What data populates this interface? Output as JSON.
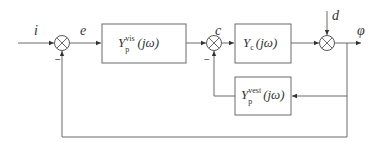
{
  "diagram": {
    "type": "feedback-control-block-diagram",
    "signals": {
      "input": "i",
      "error": "e",
      "command": "c",
      "disturbance": "d",
      "output": "φ"
    },
    "blocks": [
      {
        "id": "visual",
        "base": "Y",
        "sub": "p",
        "sup": "vis",
        "arg": "(jω)"
      },
      {
        "id": "controlled",
        "base": "Y",
        "sub": "c",
        "sup": "",
        "arg": "(jω)"
      },
      {
        "id": "vestibular",
        "base": "Y",
        "sub": "p",
        "sup": "vest",
        "arg": "(jω)"
      }
    ],
    "summing_junctions": [
      {
        "id": "sum1",
        "feedback_sign": "−"
      },
      {
        "id": "sum2",
        "feedback_sign": "−"
      },
      {
        "id": "sum3",
        "feedback_sign": ""
      }
    ]
  }
}
